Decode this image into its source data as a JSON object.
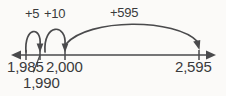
{
  "diagram": {
    "type": "number-line",
    "background_color": "#fbfaf8",
    "ink_color": "#4a4a4c",
    "text_color": "#3a3a3c",
    "axis": {
      "name": "number-line-axis",
      "left_arrow": true,
      "right_arrow": true,
      "y": 55
    },
    "ticks": [
      {
        "label": "1,985",
        "x": 26
      },
      {
        "label": "1,990",
        "x": 40
      },
      {
        "label": "2,000",
        "x": 65
      },
      {
        "label": "2,595",
        "x": 199
      }
    ],
    "jumps": [
      {
        "label": "+5",
        "from": "1,985",
        "to": "1,990",
        "value": 5
      },
      {
        "label": "+10",
        "from": "1,990",
        "to": "2,000",
        "value": 10
      },
      {
        "label": "+595",
        "from": "2,000",
        "to": "2,595",
        "value": 595
      }
    ],
    "equation": {
      "start": "1,985",
      "end": "2,595",
      "total": "+610"
    }
  }
}
